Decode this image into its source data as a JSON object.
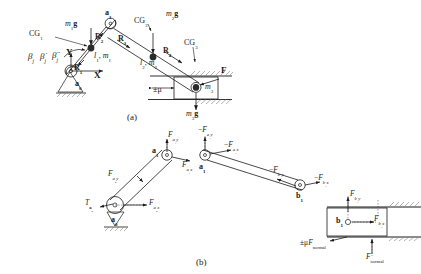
{
  "figure": {
    "captions": {
      "a": "(a)",
      "b": "(b)"
    }
  },
  "diagram_a": {
    "name": "kinematic-diagram-with-inertial-and-gravity-loads",
    "labels": {
      "ground_pivot": "a0",
      "joint_a1": "a1",
      "cg1": "CG1",
      "cg2": "CG2",
      "cg3": "CG3",
      "weight1": "m1g",
      "weight2": "m2g",
      "weight3": "m3g",
      "r1": "R1",
      "r2": "R2",
      "r3": "R3",
      "r4": "R4",
      "link1_props": "l1, m1",
      "link2_props": "l2, m2",
      "slider_mass": "m3",
      "external_force": "F",
      "friction": "±μ",
      "axis_x": "X",
      "axis_y": "Y",
      "beta": "βj",
      "beta_dot": "β̇j",
      "beta_ddot": "β̈j"
    }
  },
  "diagram_b": {
    "name": "free-body-diagrams-exploded",
    "link1": {
      "ground_pivot": "a0",
      "joint": "a1",
      "force_a1y": "Fa1y",
      "force_a1x": "Fa1x",
      "force_a0y": "Fa0y",
      "force_a0x": "Fa0x",
      "torque_a0": "Ta0"
    },
    "link2": {
      "joint_left": "a1",
      "joint_right": "b1",
      "force_neg_a1y": "-Fa1y",
      "force_neg_a1x": "-Fa1x",
      "force_neg_b1y": "-Fb1y",
      "force_neg_b1x": "-Fb1x"
    },
    "slider": {
      "label": "b1",
      "force_b1y": "Fb1y",
      "force_b1x": "Fb1x",
      "friction_force": "±μFnormal",
      "normal_force": "Fnormal"
    }
  },
  "colors": {
    "stroke": "#1a1a1a",
    "hatch": "#808080",
    "dashed": "#4d4d4d",
    "background": "#ffffff"
  }
}
